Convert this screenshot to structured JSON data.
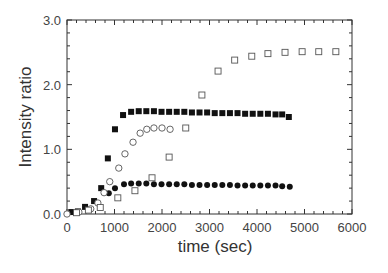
{
  "chart_data": {
    "type": "scatter",
    "title": "",
    "xlabel": "time (sec)",
    "ylabel": "Intensity ratio",
    "xlim": [
      0,
      6000
    ],
    "ylim": [
      0,
      3.0
    ],
    "xticks": [
      0,
      1000,
      2000,
      3000,
      4000,
      5000,
      6000
    ],
    "xtick_labels": [
      "0",
      "1000",
      "2000",
      "3000",
      "4000",
      "5000",
      "6000"
    ],
    "yticks": [
      0,
      1,
      2,
      3
    ],
    "ytick_labels": [
      "0.0",
      "1.0",
      "2.0",
      "3.0"
    ],
    "grid": false,
    "legend": null,
    "series": [
      {
        "name": "filled squares",
        "marker": "square-filled",
        "x": [
          90,
          230,
          380,
          570,
          720,
          860,
          1010,
          1180,
          1350,
          1510,
          1670,
          1830,
          1990,
          2150,
          2310,
          2470,
          2630,
          2790,
          2950,
          3110,
          3270,
          3430,
          3590,
          3750,
          3910,
          4070,
          4230,
          4390,
          4530,
          4670
        ],
        "y": [
          0.03,
          0.04,
          0.11,
          0.2,
          0.4,
          0.86,
          1.31,
          1.53,
          1.58,
          1.59,
          1.59,
          1.59,
          1.58,
          1.58,
          1.58,
          1.58,
          1.57,
          1.57,
          1.57,
          1.56,
          1.56,
          1.56,
          1.56,
          1.55,
          1.55,
          1.55,
          1.55,
          1.54,
          1.54,
          1.5
        ]
      },
      {
        "name": "filled circles",
        "marker": "circle-filled",
        "x": [
          880,
          1010,
          1200,
          1350,
          1510,
          1670,
          1830,
          1990,
          2150,
          2310,
          2470,
          2630,
          2790,
          2950,
          3110,
          3270,
          3430,
          3590,
          3750,
          3910,
          4070,
          4230,
          4390,
          4530,
          4690
        ],
        "y": [
          0.32,
          0.4,
          0.46,
          0.47,
          0.47,
          0.47,
          0.46,
          0.46,
          0.46,
          0.46,
          0.46,
          0.45,
          0.45,
          0.45,
          0.45,
          0.45,
          0.45,
          0.44,
          0.44,
          0.44,
          0.44,
          0.44,
          0.44,
          0.43,
          0.42
        ]
      },
      {
        "name": "open circles",
        "marker": "circle-open",
        "x": [
          0,
          250,
          500,
          650,
          780,
          900,
          1090,
          1220,
          1390,
          1540,
          1680,
          1830,
          2000,
          2170
        ],
        "y": [
          0.0,
          0.03,
          0.08,
          0.17,
          0.33,
          0.5,
          0.71,
          0.93,
          1.11,
          1.25,
          1.31,
          1.33,
          1.33,
          1.31
        ]
      },
      {
        "name": "open squares",
        "marker": "square-open",
        "x": [
          200,
          450,
          700,
          1070,
          1430,
          1790,
          2150,
          2500,
          2840,
          3180,
          3530,
          3890,
          4230,
          4590,
          4950,
          5300,
          5660
        ],
        "y": [
          0.02,
          0.06,
          0.1,
          0.25,
          0.36,
          0.56,
          0.88,
          1.33,
          1.84,
          2.21,
          2.38,
          2.44,
          2.48,
          2.5,
          2.51,
          2.51,
          2.51
        ]
      }
    ]
  }
}
